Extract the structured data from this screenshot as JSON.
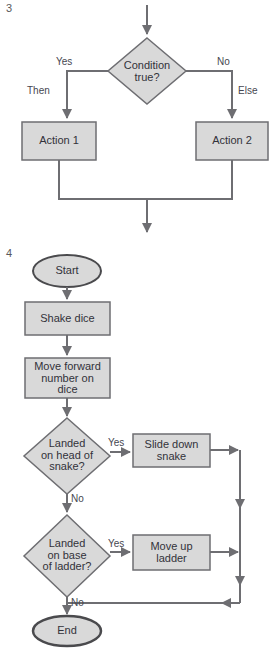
{
  "figures": [
    {
      "number": "3",
      "title": "if-then-else flowchart",
      "nodes": [
        {
          "id": "cond",
          "type": "decision",
          "label": "Condition\ntrue?"
        },
        {
          "id": "action1",
          "type": "process",
          "label": "Action 1"
        },
        {
          "id": "action2",
          "type": "process",
          "label": "Action 2"
        }
      ],
      "edge_labels": {
        "yes": "Yes",
        "no": "No",
        "then": "Then",
        "else": "Else"
      }
    },
    {
      "number": "4",
      "title": "snakes and ladders flowchart",
      "nodes": [
        {
          "id": "start",
          "type": "terminator",
          "label": "Start"
        },
        {
          "id": "shake",
          "type": "process",
          "label": "Shake dice"
        },
        {
          "id": "move",
          "type": "process",
          "label": "Move forward\nnumber on\ndice"
        },
        {
          "id": "snake_q",
          "type": "decision",
          "label": "Landed\non head of\nsnake?"
        },
        {
          "id": "slide",
          "type": "process",
          "label": "Slide down\nsnake"
        },
        {
          "id": "ladder_q",
          "type": "decision",
          "label": "Landed\non base\nof ladder?"
        },
        {
          "id": "ladder",
          "type": "process",
          "label": "Move up\nladder"
        },
        {
          "id": "end",
          "type": "terminator",
          "label": "End"
        }
      ],
      "edge_labels": {
        "snake_yes": "Yes",
        "snake_no": "No",
        "ladder_yes": "Yes",
        "ladder_no": "No"
      }
    }
  ],
  "style": {
    "shape_fill": "#d9d9d9",
    "shape_stroke": "#6e6e72",
    "terminator_stroke": "#4a4a4d",
    "line_color": "#6e6e72",
    "text_color": "#32323a",
    "background": "#ffffff"
  }
}
